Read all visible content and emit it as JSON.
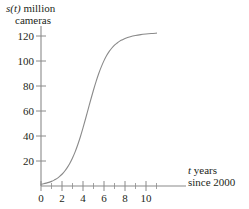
{
  "chart_data": {
    "type": "line",
    "title": "",
    "subtitle": "",
    "ylabel_line1": "s(t) million",
    "ylabel_line2": "cameras",
    "ylabel_var": "s(t)",
    "ylabel_rest": " million",
    "xlabel_line1": "t years",
    "xlabel_line2": "since 2000",
    "xlabel_var": "t",
    "xlabel_rest": " years",
    "xlabel": "t years since 2000",
    "ylabel": "s(t) million cameras",
    "grid": false,
    "legend": "none",
    "axis_color": "#8a8a8a",
    "curve_color": "#8a8a8a",
    "xlim": [
      0,
      11.2
    ],
    "ylim": [
      0,
      132
    ],
    "xticks": [
      0,
      2,
      4,
      6,
      8,
      10
    ],
    "xtick_labels": [
      "0",
      "2",
      "4",
      "6",
      "8",
      "10"
    ],
    "xminor_ticks": [
      1,
      3,
      5,
      7,
      9,
      11
    ],
    "yticks": [
      20,
      40,
      60,
      80,
      100,
      120
    ],
    "ytick_labels": [
      "20",
      "40",
      "60",
      "80",
      "100",
      "120"
    ],
    "x": [
      0,
      0.25,
      0.5,
      0.75,
      1,
      1.25,
      1.5,
      1.75,
      2,
      2.25,
      2.5,
      2.75,
      3,
      3.25,
      3.5,
      3.75,
      4,
      4.25,
      4.5,
      4.75,
      5,
      5.25,
      5.5,
      5.75,
      6,
      6.25,
      6.5,
      6.75,
      7,
      7.25,
      7.5,
      7.75,
      8,
      8.5,
      9,
      9.5,
      10,
      10.5,
      11
    ],
    "values": [
      1.4,
      1.8,
      2.3,
      2.9,
      3.7,
      4.7,
      5.9,
      7.5,
      9.4,
      11.8,
      14.7,
      18.2,
      22.4,
      27.3,
      33.0,
      39.4,
      46.5,
      54.0,
      61.7,
      69.4,
      76.8,
      83.7,
      90.0,
      95.5,
      100.3,
      104.4,
      107.7,
      110.4,
      112.7,
      114.4,
      115.9,
      117.0,
      118.0,
      119.4,
      120.4,
      121.1,
      121.6,
      122.0,
      122.3
    ],
    "series": [
      {
        "name": "s(t)",
        "values": [
          1.4,
          1.8,
          2.3,
          2.9,
          3.7,
          4.7,
          5.9,
          7.5,
          9.4,
          11.8,
          14.7,
          18.2,
          22.4,
          27.3,
          33.0,
          39.4,
          46.5,
          54.0,
          61.7,
          69.4,
          76.8,
          83.7,
          90.0,
          95.5,
          100.3,
          104.4,
          107.7,
          110.4,
          112.7,
          114.4,
          115.9,
          117.0,
          118.0,
          119.4,
          120.4,
          121.1,
          121.6,
          122.0,
          122.3
        ]
      }
    ]
  }
}
